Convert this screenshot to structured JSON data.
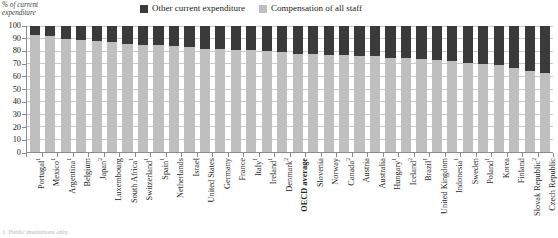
{
  "axis_title": "% of current expenditure",
  "legend": {
    "position": "top-center",
    "entries": [
      {
        "label": "Other current expenditure",
        "color": "#3a3a3a",
        "swatch": "legend-swatch-other"
      },
      {
        "label": "Compensation of all staff",
        "color": "#bfbfbf",
        "swatch": "legend-swatch-compensation"
      }
    ]
  },
  "footnote": "1. Public institutions only.",
  "chart_data": {
    "type": "bar",
    "stacked": true,
    "title": "",
    "subtitle": "",
    "xlabel": "",
    "ylabel": "% of current expenditure",
    "ylim": [
      0,
      100
    ],
    "yticks": [
      0,
      10,
      20,
      30,
      40,
      50,
      60,
      70,
      80,
      90,
      100
    ],
    "grid": true,
    "legend_position": "top-center",
    "categories": [
      "Portugal¹",
      "Mexico¹",
      "Argentina¹",
      "Belgium",
      "Japan²",
      "Luxembourg",
      "South Africa¹",
      "Switzerland¹",
      "Spain¹",
      "Netherlands",
      "Israel",
      "United States",
      "Germany",
      "France",
      "Italy¹",
      "Ireland¹",
      "Denmark²",
      "OECD average",
      "Slovenia",
      "Norway",
      "Canada²",
      "Austria",
      "Australia",
      "Hungary¹",
      "Iceland²",
      "Brazil¹",
      "United Kingdom",
      "Indonesia¹",
      "Sweden",
      "Poland¹",
      "Korea",
      "Finland",
      "Slovak Republic²",
      "Czech Republic"
    ],
    "category_notes": [
      "1",
      "1",
      "1",
      "",
      "2",
      "",
      "1",
      "1",
      "1",
      "",
      "",
      "",
      "",
      "",
      "1",
      "1",
      "2",
      "",
      "",
      "",
      "2",
      "",
      "",
      "1",
      "2",
      "1",
      "",
      "1",
      "",
      "1",
      "",
      "",
      "2",
      ""
    ],
    "highlight_category": "OECD average",
    "series": [
      {
        "name": "Compensation of all staff",
        "color": "#bfbfbf",
        "values": [
          93,
          92,
          90,
          89,
          88,
          87,
          86,
          85,
          85,
          84,
          83,
          82,
          82,
          81,
          81,
          80,
          79,
          78,
          78,
          77,
          77,
          76,
          76,
          75,
          75,
          74,
          73,
          72,
          71,
          70,
          69,
          67,
          64,
          63
        ]
      },
      {
        "name": "Other current expenditure",
        "color": "#3a3a3a",
        "values": [
          7,
          8,
          10,
          11,
          12,
          13,
          14,
          15,
          15,
          16,
          17,
          18,
          18,
          19,
          19,
          20,
          21,
          22,
          22,
          23,
          23,
          24,
          24,
          25,
          25,
          26,
          27,
          28,
          29,
          30,
          31,
          33,
          36,
          37
        ]
      }
    ]
  }
}
